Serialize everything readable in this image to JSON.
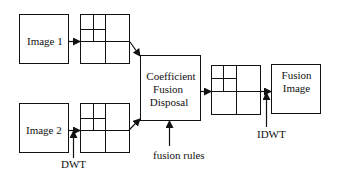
{
  "diagram": {
    "title": "",
    "nodes": {
      "image1": {
        "label": "Image 1"
      },
      "image2": {
        "label": "Image 2"
      },
      "coefficient": {
        "line1": "Coefficient",
        "line2": "Fusion",
        "line3": "Disposal"
      },
      "fusion_image": {
        "line1": "Fusion",
        "line2": "Image"
      },
      "dwt_grid_1": {
        "label": ""
      },
      "dwt_grid_2": {
        "label": ""
      },
      "fused_grid": {
        "label": ""
      }
    },
    "annotations": {
      "dwt": "DWT",
      "fusion_rules": "fusion rules",
      "idwt": "IDWT"
    },
    "edges": [
      {
        "from": "image1",
        "to": "dwt_grid_1"
      },
      {
        "from": "image2",
        "to": "dwt_grid_2"
      },
      {
        "from": "dwt_grid_1",
        "to": "coefficient"
      },
      {
        "from": "dwt_grid_2",
        "to": "coefficient"
      },
      {
        "from": "coefficient",
        "to": "fused_grid"
      },
      {
        "from": "fused_grid",
        "to": "fusion_image"
      },
      {
        "from": "dwt",
        "to": "dwt_grid_2"
      },
      {
        "from": "fusion_rules",
        "to": "coefficient"
      },
      {
        "from": "idwt",
        "to": "fusion_image"
      }
    ],
    "colors": {
      "stroke": "#111111",
      "background": "#ffffff"
    }
  }
}
